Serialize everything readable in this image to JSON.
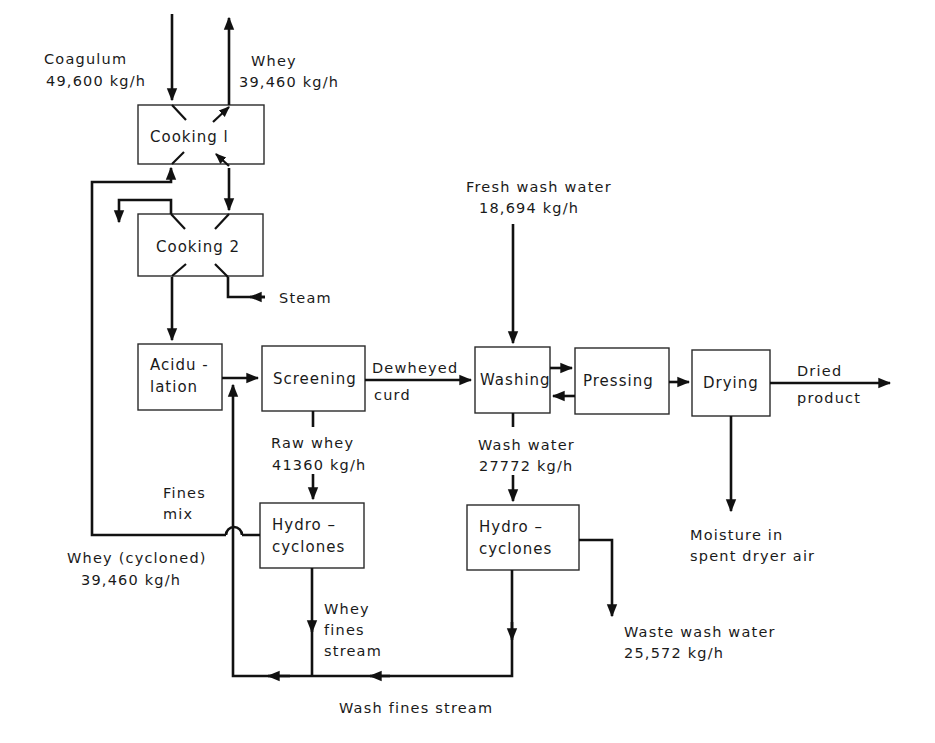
{
  "diagram": {
    "type": "process-flow",
    "units": {
      "cooking1": "Cooking l",
      "cooking2": "Cooking 2",
      "acidulation": [
        "Acidu -",
        "lation"
      ],
      "screening": "Screening",
      "washing": "Washing",
      "pressing": "Pressing",
      "drying": "Drying",
      "hydrocyclones_whey": [
        "Hydro –",
        "cyclones"
      ],
      "hydrocyclones_wash": [
        "Hydro –",
        "cyclones"
      ]
    },
    "streams": {
      "coagulum": {
        "name": "Coagulum",
        "rate": "49,600 kg/h"
      },
      "whey_out": {
        "name": "Whey",
        "rate": "39,460 kg/h"
      },
      "steam": {
        "name": "Steam"
      },
      "fresh_wash_water": {
        "name": "Fresh wash water",
        "rate": "18,694 kg/h"
      },
      "dewheyed_curd": [
        "Dewheyed",
        "curd"
      ],
      "dried_product": [
        "Dried",
        "product"
      ],
      "raw_whey": {
        "name": "Raw whey",
        "rate": "41360 kg/h"
      },
      "wash_water": {
        "name": "Wash water",
        "rate": "27772 kg/h"
      },
      "fines_mix": [
        "Fines",
        "mix"
      ],
      "whey_cycloned": {
        "name": "Whey (cycloned)",
        "rate": "39,460 kg/h"
      },
      "moisture": [
        "Moisture in",
        "spent dryer air"
      ],
      "whey_fines_stream": [
        "Whey",
        "fines",
        "stream"
      ],
      "waste_wash_water": {
        "name": "Waste wash water",
        "rate": "25,572 kg/h"
      },
      "wash_fines_stream": "Wash fines stream"
    }
  }
}
